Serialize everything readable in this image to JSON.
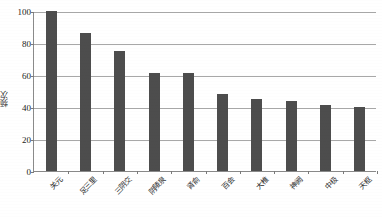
{
  "chart_data": {
    "type": "bar",
    "title": "",
    "xlabel": "",
    "ylabel": "频次",
    "ylim": [
      0,
      100
    ],
    "yticks": [
      0,
      20,
      40,
      60,
      80,
      100
    ],
    "grid": true,
    "legend": "none",
    "categories": [
      "关元",
      "足三里",
      "三阴交",
      "阴陵泉",
      "肾俞",
      "百会",
      "大椎",
      "神阙",
      "中极",
      "天枢"
    ],
    "values": [
      100,
      86,
      75,
      61,
      61,
      48,
      45,
      44,
      41,
      40
    ],
    "series": [
      {
        "name": "频次",
        "values": [
          100,
          86,
          75,
          61,
          61,
          48,
          45,
          44,
          41,
          40
        ]
      }
    ]
  },
  "style": {
    "bar_color": "#4d4d4d",
    "grid_color": "#a8a8a8",
    "axis_color": "#8a8a8a",
    "text_color": "#2b2b2b",
    "background": "#ffffff"
  }
}
